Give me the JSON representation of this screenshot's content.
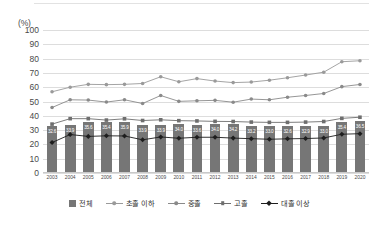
{
  "axis_unit_label": "(%)",
  "legend": {
    "items": [
      {
        "label": "전체",
        "type": "bar",
        "color": "#767676"
      },
      {
        "label": "초졸 이하",
        "type": "line",
        "color": "#9a9a9a"
      },
      {
        "label": "중졸",
        "type": "line",
        "color": "#8a8a8a"
      },
      {
        "label": "고졸",
        "type": "line",
        "color": "#6e6e6e"
      },
      {
        "label": "대졸 이상",
        "type": "line",
        "color": "#1d1d1d"
      }
    ]
  },
  "chart_data": {
    "type": "bar",
    "title": "",
    "subtitle": "",
    "xlabel": "",
    "ylabel": "(%)",
    "ylim": [
      0,
      100
    ],
    "yticks": [
      0,
      10,
      20,
      30,
      40,
      50,
      60,
      70,
      80,
      90,
      100
    ],
    "grid": true,
    "legend_position": "bottom",
    "categories": [
      "2003",
      "2004",
      "2005",
      "2006",
      "2007",
      "2008",
      "2009",
      "2010",
      "2011",
      "2012",
      "2013",
      "2014",
      "2015",
      "2016",
      "2017",
      "2018",
      "2019",
      "2020"
    ],
    "bar_series": {
      "name": "전체",
      "color": "#767676",
      "values": [
        32.6,
        33.9,
        35.6,
        35.4,
        35.9,
        33.9,
        33.9,
        34.0,
        33.6,
        34.0,
        34.2,
        33.2,
        33.0,
        32.6,
        32.9,
        33.0,
        35.4,
        36.5
      ],
      "labels": [
        "32.6",
        "33.9",
        "35.6",
        "35.4",
        "35.9",
        "33.9",
        "33.9",
        "34.0",
        "33.6",
        "34.0",
        "34.2",
        "33.2",
        "33.0",
        "32.6",
        "32.9",
        "33.0",
        "35.4",
        "36.5"
      ]
    },
    "series": [
      {
        "name": "초졸 이하",
        "color": "#9a9a9a",
        "marker": "circle",
        "values": [
          56.8,
          60.0,
          62.0,
          61.8,
          62.0,
          62.6,
          67.3,
          63.8,
          66.0,
          64.3,
          63.2,
          63.6,
          64.9,
          66.6,
          68.5,
          70.5,
          77.8,
          78.5
        ]
      },
      {
        "name": "중졸",
        "color": "#8a8a8a",
        "marker": "circle",
        "values": [
          45.8,
          51.2,
          51.0,
          49.6,
          51.2,
          48.6,
          54.2,
          50.1,
          50.5,
          50.8,
          49.5,
          51.7,
          51.2,
          53.0,
          54.2,
          55.6,
          60.4,
          61.9
        ]
      },
      {
        "name": "고졸",
        "color": "#6e6e6e",
        "marker": "square",
        "values": [
          34.2,
          38.0,
          38.0,
          37.0,
          37.9,
          36.7,
          37.2,
          36.6,
          36.4,
          36.1,
          36.0,
          35.6,
          35.4,
          35.4,
          35.6,
          36.0,
          38.2,
          39.0
        ]
      },
      {
        "name": "대졸 이상",
        "color": "#1d1d1d",
        "marker": "diamond",
        "values": [
          21.3,
          26.9,
          25.6,
          26.0,
          25.9,
          23.2,
          25.2,
          24.3,
          25.0,
          25.0,
          24.4,
          24.0,
          23.6,
          23.9,
          24.1,
          24.5,
          27.1,
          27.5
        ]
      }
    ]
  }
}
